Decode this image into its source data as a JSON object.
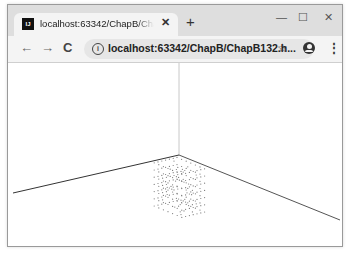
{
  "browser": {
    "tab": {
      "favicon_label": "IJ",
      "title": "localhost:63342/ChapB/ChapB132.html",
      "close_glyph": "✕"
    },
    "new_tab_glyph": "+",
    "window_controls": {
      "minimize": "—",
      "maximize": "☐",
      "close": "✕"
    },
    "nav": {
      "back": "←",
      "forward": "→",
      "reload": "C"
    },
    "omnibox": {
      "info_glyph": "i",
      "url": "localhost:63342/ChapB/ChapB132.h..."
    },
    "bookmark_glyph": "☆",
    "menu_glyph": "⋮"
  },
  "scene": {
    "description": "3D scene with three axis lines meeting at origin and a cubic lattice of point sprites",
    "background": "#ffffff",
    "axis_color": "#333333",
    "vertical_axis_color": "#cccccc",
    "point_color": "#888888"
  }
}
